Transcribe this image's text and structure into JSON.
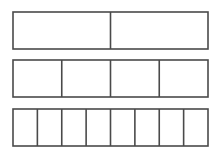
{
  "diagram": {
    "title": "",
    "stroke_color": "#4a4a4a",
    "background_color": "#ffffff",
    "bars": [
      {
        "name": "halves",
        "parts": 2
      },
      {
        "name": "fourths",
        "parts": 4
      },
      {
        "name": "eighths",
        "parts": 8
      }
    ]
  }
}
